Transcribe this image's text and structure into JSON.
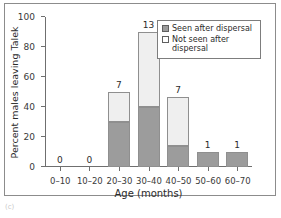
{
  "figure": {
    "caption_mark": "(c)"
  },
  "chart_data": {
    "type": "bar",
    "title": "",
    "subtitle": "",
    "xlabel": "Age (months)",
    "ylabel": "Percent males leaving Talek",
    "categories": [
      "0–10",
      "10–20",
      "20–30",
      "30–40",
      "40–50",
      "50–60",
      "60–70"
    ],
    "ylim": [
      0,
      100
    ],
    "yticks": [
      0,
      20,
      40,
      60,
      80,
      100
    ],
    "ytick_labels": [
      "0",
      "20",
      "40",
      "60",
      "80",
      "100"
    ],
    "grid": false,
    "stacked": true,
    "legend_position": "top-right",
    "series": [
      {
        "name": "Seen after dispersal",
        "color": "#9c9c9c",
        "values": [
          0,
          0,
          30,
          40,
          14,
          10,
          10
        ]
      },
      {
        "name": "Not seen after dispersal",
        "color": "#efefef",
        "values": [
          0,
          0,
          20,
          50,
          33,
          0,
          0
        ]
      }
    ],
    "totals": [
      0,
      0,
      50,
      90,
      47,
      10,
      10
    ],
    "bar_labels": [
      "0",
      "0",
      "7",
      "13",
      "7",
      "1",
      "1"
    ],
    "annotations": [
      {
        "category": "0–10",
        "text": "0"
      },
      {
        "category": "10–20",
        "text": "0"
      },
      {
        "category": "20–30",
        "text": "7"
      },
      {
        "category": "30–40",
        "text": "13"
      },
      {
        "category": "40–50",
        "text": "7"
      },
      {
        "category": "50–60",
        "text": "1"
      },
      {
        "category": "60–70",
        "text": "1"
      }
    ]
  },
  "legend": {
    "items": [
      {
        "label": "Seen after dispersal",
        "swatch": "filled"
      },
      {
        "label": "Not seen after dispersal",
        "swatch": "empty"
      }
    ]
  }
}
